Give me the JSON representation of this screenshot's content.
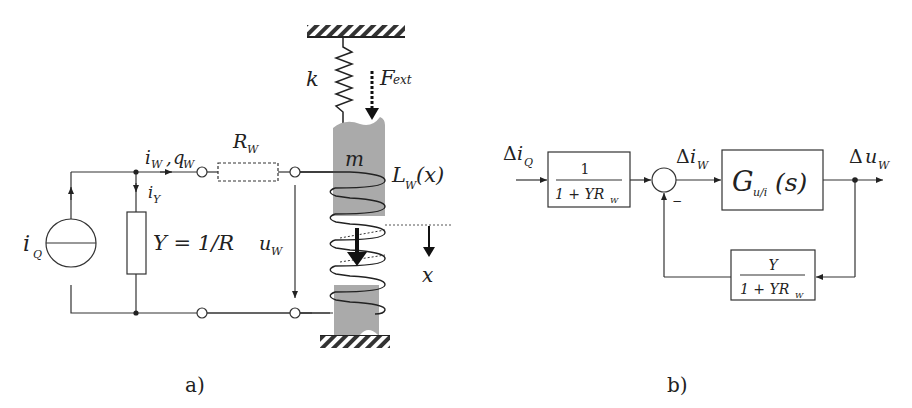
{
  "figure": {
    "panel_a": {
      "caption": "a)",
      "labels": {
        "current_source": "i",
        "current_source_sub": "Q",
        "branch_current": "i",
        "branch_current_sub": "W",
        "charge": "q",
        "charge_sub": "W",
        "shunt_current": "i",
        "shunt_current_sub": "Y",
        "admittance": "Y = 1/R",
        "resistor": "R",
        "resistor_sub": "W",
        "voltage": "u",
        "voltage_sub": "W",
        "spring": "k",
        "force": "F",
        "force_sub": "ext",
        "mass": "m",
        "inductance": "L",
        "inductance_sub": "W",
        "inductance_arg": "(x)",
        "displacement": "x"
      }
    },
    "panel_b": {
      "caption": "b)",
      "input": {
        "delta": "Δ",
        "var": "i",
        "sub": "Q"
      },
      "error": {
        "delta": "Δ",
        "var": "i",
        "sub": "W"
      },
      "output": {
        "delta": "Δ",
        "var": "u",
        "sub": "W"
      },
      "prefilter": {
        "num": "1",
        "den": "1 + YR",
        "den_sub": "W"
      },
      "plant": {
        "var": "G",
        "sub": "u/i",
        "arg": "(s)"
      },
      "feedback": {
        "num": "Y",
        "den": "1 + YR",
        "den_sub": "W"
      },
      "summing_sign": "−"
    }
  }
}
